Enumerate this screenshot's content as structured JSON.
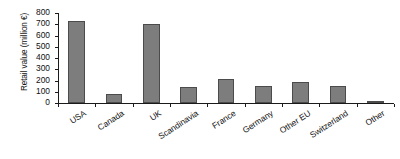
{
  "chart_data": {
    "type": "bar",
    "title": "",
    "subtitle": "",
    "xlabel": "",
    "ylabel": "Retail value (million €)",
    "categories": [
      "USA",
      "Canada",
      "UK",
      "Scandinavia",
      "France",
      "Germany",
      "Other EU",
      "Switzerland",
      "Other"
    ],
    "values": [
      725,
      80,
      700,
      140,
      210,
      150,
      190,
      150,
      20
    ],
    "ylim": [
      0,
      800
    ],
    "ytick_labels": [
      "800",
      "700",
      "600",
      "500",
      "400",
      "300",
      "200",
      "100",
      "0"
    ],
    "ytick_values": [
      800,
      700,
      600,
      500,
      400,
      300,
      200,
      100,
      0
    ],
    "grid": false,
    "legend": null,
    "legend_position": "none",
    "bar_color": "#7d7d7d",
    "bar_edge_color": "#4b4b4b",
    "axis_color": "#1a1a1a",
    "background_color": "#ffffff"
  }
}
